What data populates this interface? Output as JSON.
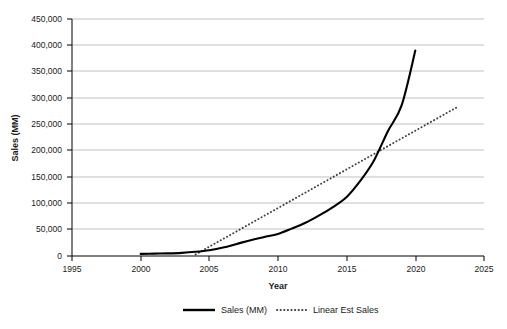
{
  "chart_data": {
    "type": "line",
    "title": "",
    "xlabel": "Year",
    "ylabel": "Sales (MM)",
    "xlim": [
      1995,
      2025
    ],
    "ylim": [
      0,
      450000
    ],
    "xticks": [
      1995,
      2000,
      2005,
      2010,
      2015,
      2020,
      2025
    ],
    "xtick_labels": [
      "1995",
      "2000",
      "2005",
      "2010",
      "2015",
      "2020",
      "2025"
    ],
    "yticks": [
      0,
      50000,
      100000,
      150000,
      200000,
      250000,
      300000,
      350000,
      400000,
      450000
    ],
    "ytick_labels": [
      "0",
      "50,000",
      "100,000",
      "150,000",
      "200,000",
      "250,000",
      "300,000",
      "350,000",
      "400,000",
      "450,000"
    ],
    "grid": "horizontal",
    "legend_position": "bottom",
    "series": [
      {
        "name": "Sales (MM)",
        "style": "solid",
        "color": "#000000",
        "x": [
          2000,
          2001,
          2002,
          2003,
          2004,
          2005,
          2006,
          2007,
          2008,
          2009,
          2010,
          2011,
          2012,
          2013,
          2014,
          2015,
          2016,
          2017,
          2018,
          2019,
          2020
        ],
        "y": [
          4000,
          4500,
          5000,
          6000,
          8000,
          11000,
          16000,
          23000,
          30000,
          36000,
          42000,
          52000,
          63000,
          77000,
          93000,
          112000,
          143000,
          182000,
          237000,
          286000,
          390000
        ]
      },
      {
        "name": "Linear Est Sales",
        "style": "dotted",
        "color": "#3f3f3f",
        "x": [
          2004,
          2023
        ],
        "y": [
          3000,
          282000
        ]
      }
    ],
    "annotations": {
      "crossover_year": 2017.5,
      "crossover_value": 200000
    }
  },
  "legend": {
    "items": [
      {
        "label": "Sales (MM)",
        "style": "solid"
      },
      {
        "label": "Linear Est Sales",
        "style": "dotted"
      }
    ]
  }
}
